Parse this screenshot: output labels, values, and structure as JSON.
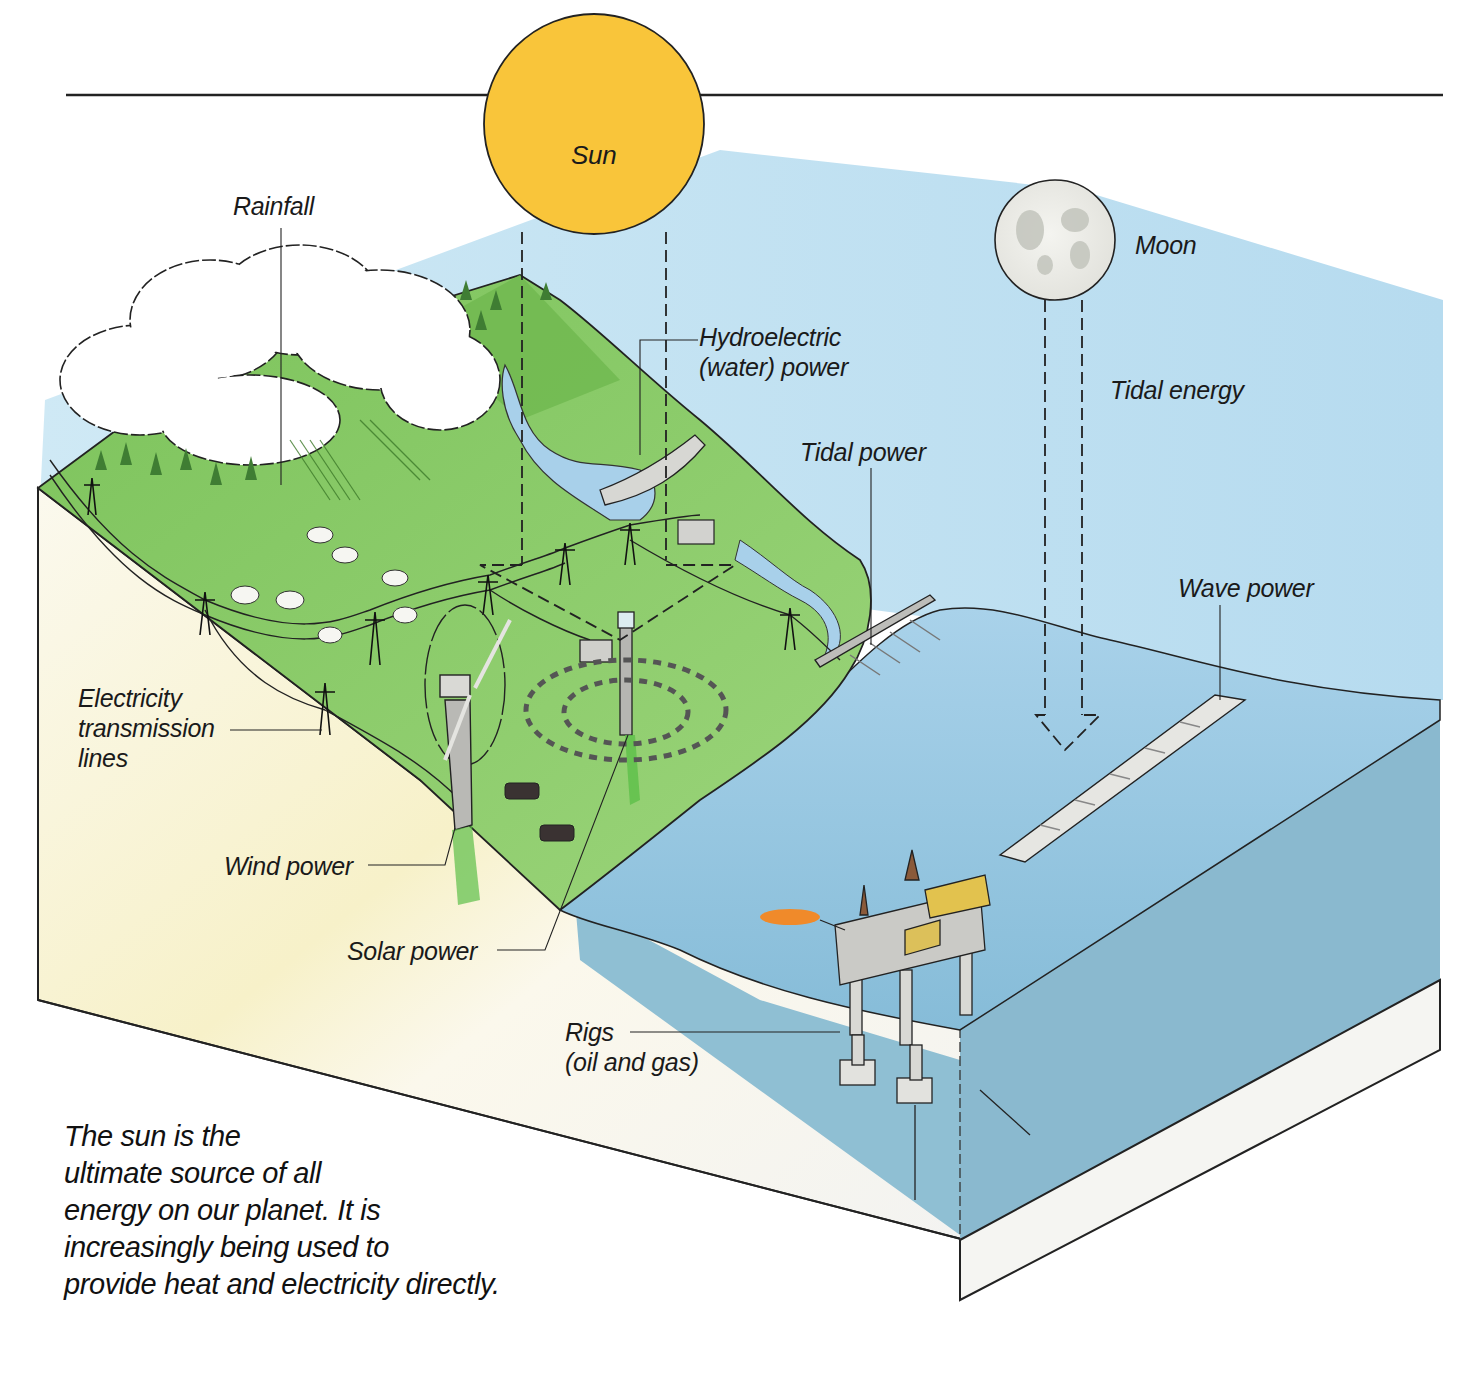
{
  "diagram": {
    "title_rule": true,
    "bodies": {
      "sun": {
        "label": "Sun",
        "color": "#f9c53a"
      },
      "moon": {
        "label": "Moon",
        "color": "#eeeeea"
      }
    },
    "labels": {
      "rainfall": "Rainfall",
      "hydro_line1": "Hydroelectric",
      "hydro_line2": "(water) power",
      "tidal_energy": "Tidal energy",
      "tidal_power": "Tidal power",
      "wave_power": "Wave power",
      "electricity_line1": "Electricity",
      "electricity_line2": "transmission",
      "electricity_line3": "lines",
      "wind_power": "Wind power",
      "solar_power": "Solar power",
      "rigs_line1": "Rigs",
      "rigs_line2": "(oil and gas)"
    },
    "caption": {
      "lines": [
        "The sun is the",
        "ultimate source of all",
        "energy on our planet. It is",
        "increasingly being used to",
        "provide heat and electricity directly."
      ]
    },
    "colors": {
      "sky": "#bfe0f0",
      "land": "#8fcf6a",
      "land_dark": "#6fb34f",
      "sea": "#9cc8e0",
      "sea_deep": "#7fb2c8",
      "rock": "#f4f2ea",
      "sun": "#f9c53a",
      "outline": "#1e1e1e"
    }
  }
}
